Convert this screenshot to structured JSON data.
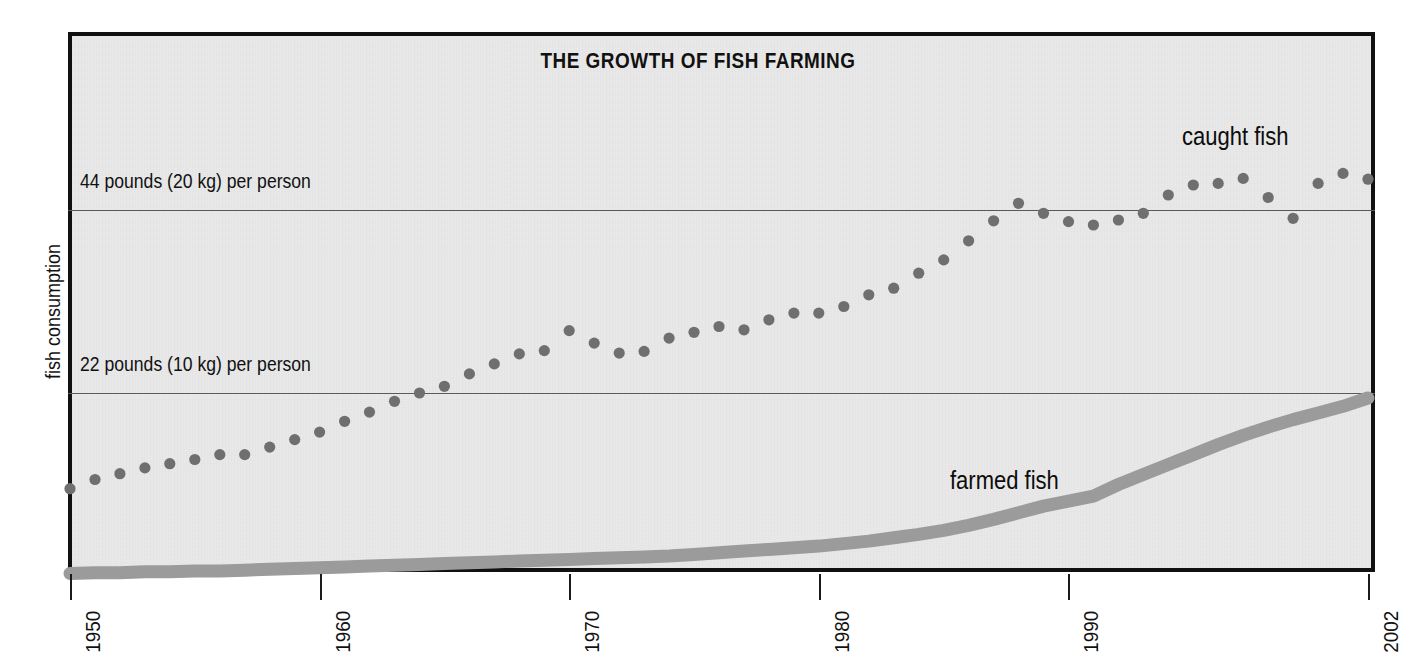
{
  "chart_data": {
    "type": "line",
    "title": "THE GROWTH OF FISH FARMING",
    "xlabel": "",
    "ylabel": "fish consumption",
    "xlim": [
      1950,
      2002
    ],
    "ylim": [
      0,
      65
    ],
    "grid": true,
    "legend_position": "inline-annotations",
    "x_tick_labels": [
      "1950",
      "1960",
      "1970",
      "1980",
      "1990",
      "2002"
    ],
    "x_tick_values": [
      1950,
      1960,
      1970,
      1980,
      1990,
      2002
    ],
    "y_gridlines": [
      {
        "value": 44,
        "label": "44 pounds (20 kg) per person"
      },
      {
        "value": 22,
        "label": "22 pounds (10 kg) per person"
      }
    ],
    "units": "pounds per person per year",
    "x": [
      1950,
      1951,
      1952,
      1953,
      1954,
      1955,
      1956,
      1957,
      1958,
      1959,
      1960,
      1961,
      1962,
      1963,
      1964,
      1965,
      1966,
      1967,
      1968,
      1969,
      1970,
      1971,
      1972,
      1973,
      1974,
      1975,
      1976,
      1977,
      1978,
      1979,
      1980,
      1981,
      1982,
      1983,
      1984,
      1985,
      1986,
      1987,
      1988,
      1989,
      1990,
      1991,
      1992,
      1993,
      1994,
      1995,
      1996,
      1997,
      1998,
      1999,
      2000,
      2001,
      2002
    ],
    "series": [
      {
        "name": "caught fish",
        "style": "dotted-markers",
        "color": "#6f6f6f",
        "values": [
          10.5,
          11.6,
          12.3,
          13.0,
          13.5,
          14.0,
          14.6,
          14.6,
          15.5,
          16.4,
          17.3,
          18.6,
          19.7,
          21.0,
          22.0,
          22.8,
          24.3,
          25.5,
          26.7,
          27.1,
          29.5,
          28.0,
          26.8,
          27.0,
          28.6,
          29.3,
          30.0,
          29.6,
          30.8,
          31.6,
          31.6,
          32.4,
          33.8,
          34.6,
          36.4,
          38.0,
          40.3,
          42.7,
          44.8,
          43.6,
          42.6,
          42.2,
          42.8,
          43.6,
          45.8,
          47.0,
          47.2,
          47.8,
          45.5,
          43.0,
          47.2,
          48.4,
          47.7
        ]
      },
      {
        "name": "farmed fish",
        "style": "thick-band",
        "color": "#9b9b9b",
        "values": [
          0.3,
          0.4,
          0.4,
          0.5,
          0.5,
          0.6,
          0.6,
          0.7,
          0.8,
          0.9,
          1.0,
          1.1,
          1.2,
          1.3,
          1.4,
          1.5,
          1.6,
          1.7,
          1.8,
          1.9,
          2.0,
          2.1,
          2.2,
          2.3,
          2.4,
          2.6,
          2.8,
          3.0,
          3.2,
          3.4,
          3.6,
          3.9,
          4.2,
          4.6,
          5.0,
          5.5,
          6.1,
          6.8,
          7.6,
          8.4,
          9.0,
          9.6,
          11.0,
          12.2,
          13.4,
          14.6,
          15.8,
          16.9,
          17.9,
          18.8,
          19.6,
          20.4,
          21.4
        ]
      }
    ],
    "annotations": [
      {
        "text": "caught fish",
        "x": 1995,
        "y": 52
      },
      {
        "text": "farmed fish",
        "x": 1985,
        "y": 13
      }
    ]
  },
  "chart": {
    "title": "THE GROWTH OF FISH FARMING",
    "y_axis_label": "fish consumption",
    "gridline_labels": {
      "upper": "44 pounds (20 kg) per person",
      "lower": "22 pounds (10 kg) per person"
    },
    "series_labels": {
      "caught": "caught fish",
      "farmed": "farmed fish"
    },
    "x_ticks": [
      "1950",
      "1960",
      "1970",
      "1980",
      "1990",
      "2002"
    ],
    "colors": {
      "plot_background": "#e9e9e9",
      "frame": "#111111",
      "caught_fish": "#6f6f6f",
      "farmed_fish": "#9b9b9b",
      "gridline": "#5a5a5a",
      "text": "#111111",
      "page_background": "#ffffff"
    }
  }
}
